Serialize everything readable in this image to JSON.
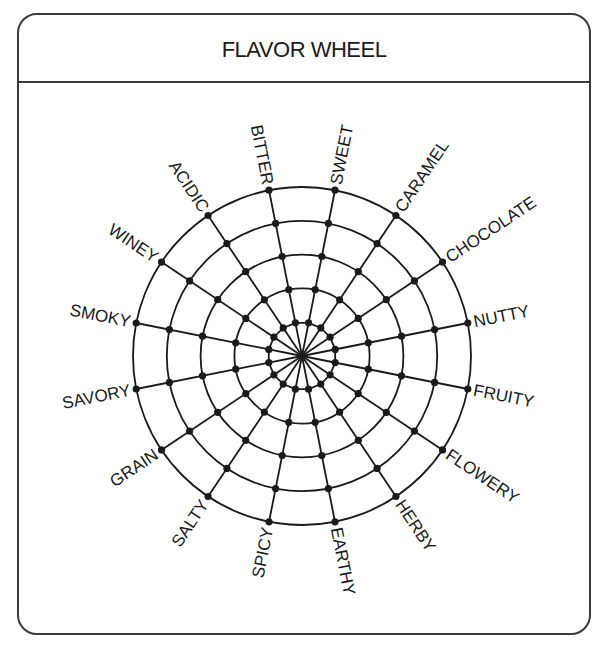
{
  "header": {
    "title": "FLAVOR WHEEL"
  },
  "wheel": {
    "center": [
      302,
      356
    ],
    "ring_count": 5,
    "ring_step": 33.8,
    "start_angle_deg": -11.25,
    "step_angle_deg": 22.5,
    "line_color": "#1a1a1a",
    "labels": [
      "NUTTY",
      "FRUITY",
      "FLOWERY",
      "HERBY",
      "EARTHY",
      "SPICY",
      "SALTY",
      "GRAIN",
      "SAVORY",
      "SMOKY",
      "WINEY",
      "ACIDIC",
      "BITTER",
      "SWEET",
      "CARAMEL",
      "CHOCOLATE"
    ]
  }
}
